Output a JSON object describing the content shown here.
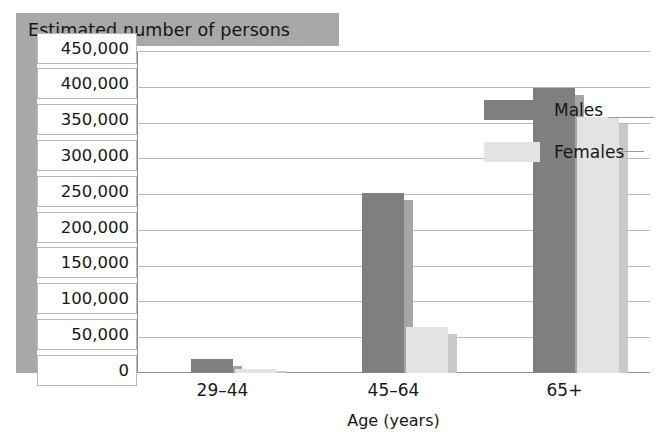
{
  "title": {
    "text": "Estimated number of persons"
  },
  "axes": {
    "x_title": "Age (years)",
    "y_title": "Estimated number of persons",
    "categories": [
      "29–44",
      "45–64",
      "65+"
    ],
    "y_ticks": [
      "0",
      "50,000",
      "100,000",
      "150,000",
      "200,000",
      "250,000",
      "300,000",
      "350,000",
      "400,000",
      "450,000"
    ]
  },
  "legend": {
    "position": "top-right",
    "entries": [
      {
        "label": "Males",
        "color": "#7f7f7f"
      },
      {
        "label": "Females",
        "color": "#e3e3e3"
      }
    ]
  },
  "colors": {
    "male_bar": "#7f7f7f",
    "male_side": "#a6a6a6",
    "female_bar": "#e3e3e3",
    "female_side": "#c9c9c9",
    "band": "#a8a8a8",
    "gridline": "#b9b9b9",
    "axis": "#8f8f8f",
    "text": "#181818",
    "plot_background": "#ffffff"
  },
  "chart_data": {
    "type": "bar",
    "title": "Estimated number of persons",
    "xlabel": "Age (years)",
    "ylabel": "Estimated number of persons",
    "categories": [
      "29–44",
      "45–64",
      "65+"
    ],
    "series": [
      {
        "name": "Males",
        "color": "#7f7f7f",
        "values": [
          20000,
          252000,
          398000
        ]
      },
      {
        "name": "Females",
        "color": "#e3e3e3",
        "values": [
          5000,
          65000,
          358000
        ]
      }
    ],
    "ylim": [
      0,
      450000
    ],
    "ytick_step": 50000,
    "ytick_labels": [
      "0",
      "50,000",
      "100,000",
      "150,000",
      "200,000",
      "250,000",
      "300,000",
      "350,000",
      "400,000",
      "450,000"
    ],
    "grid": true,
    "grid_axis": "y",
    "legend": "upper right",
    "bar_style": "3d-shadow"
  }
}
